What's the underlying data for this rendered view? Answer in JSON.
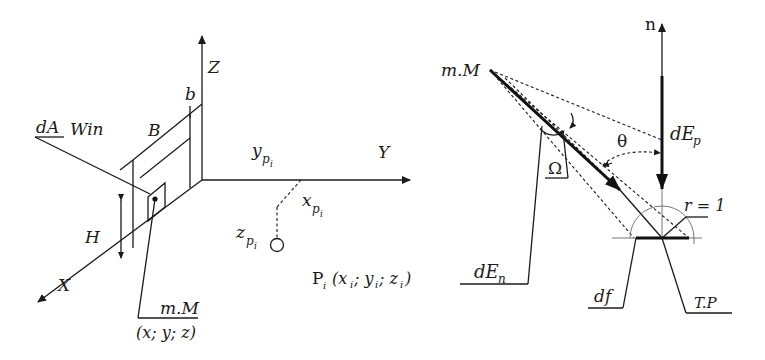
{
  "left_diagram": {
    "axes": {
      "x": "X",
      "y": "Y",
      "z": "Z"
    },
    "labels": {
      "dA": "dA",
      "win": "Win",
      "B": "B",
      "b": "b",
      "H": "H",
      "mM": "m.M",
      "mM_coords": "(x; y; z)",
      "yp": "y",
      "yp_sub": "p",
      "yp_subsub": "i",
      "xp": "x",
      "xp_sub": "p",
      "xp_subsub": "i",
      "zp": "z",
      "zp_sub": "p",
      "zp_subsub": "i",
      "Pi": "P",
      "Pi_sub": "i",
      "Pi_coords": "(x",
      "Pi_c1": "i",
      "Pi_sep1": "; y",
      "Pi_c2": "i",
      "Pi_sep2": "; z",
      "Pi_c3": "i",
      "Pi_close": ")"
    }
  },
  "right_diagram": {
    "labels": {
      "n": "n",
      "mM": "m.M",
      "dEp": "dE",
      "dEp_sub": "p",
      "theta": "θ",
      "omega": "Ω",
      "r": "r = 1",
      "dEn": "dE",
      "dEn_sub": "n",
      "df": "df",
      "TP": "T.P"
    }
  },
  "colors": {
    "ink": "#1a1a1a",
    "background": "#ffffff",
    "guide": "#777777"
  }
}
